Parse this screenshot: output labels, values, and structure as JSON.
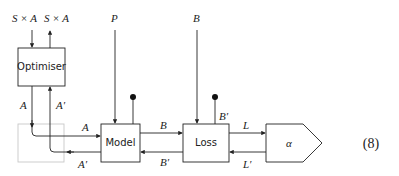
{
  "diagram": {
    "top_labels": {
      "in": "S × A",
      "out": "S × A",
      "p": "P",
      "b": "B"
    },
    "boxes": {
      "optimiser": "Optimiser",
      "model": "Model",
      "loss": "Loss",
      "alpha": "α"
    },
    "wire_labels": {
      "opt_a": "A",
      "opt_aprime": "A′",
      "model_in_a": "A",
      "model_out_aprime": "A′",
      "model_b": "B",
      "loss_bprime": "B′",
      "loss_side_bprime": "B′",
      "loss_l": "L",
      "alpha_lprime": "L′"
    },
    "equation_number": "(8)",
    "colors": {
      "line": "#222222",
      "ghost_box": "#c8c8c8"
    }
  }
}
